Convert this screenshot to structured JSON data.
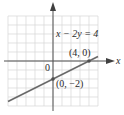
{
  "chart_data": {
    "type": "line",
    "title": "",
    "equation": "x − 2y = 4",
    "xlabel": "x",
    "ylabel": "y",
    "origin_label": "0",
    "grid": true,
    "xlim": [
      -5,
      5
    ],
    "ylim": [
      -5,
      5
    ],
    "series": [
      {
        "name": "x − 2y = 4",
        "x": [
          -5,
          5
        ],
        "y": [
          -4.5,
          0.5
        ],
        "color": "#606060"
      }
    ],
    "points": [
      {
        "x": 4,
        "y": 0,
        "label": "(4, 0)"
      },
      {
        "x": 0,
        "y": -2,
        "label": "(0, −2)"
      }
    ]
  },
  "labels": {
    "equation": "x − 2y = 4",
    "point_a": "(4, 0)",
    "point_b": "(0, −2)",
    "origin": "0",
    "x_axis": "x"
  },
  "colors": {
    "grid": "#d4d4d4",
    "axis": "#505050",
    "line": "#6a6a6a",
    "point": "#505050"
  }
}
